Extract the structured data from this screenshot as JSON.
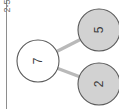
{
  "figure": {
    "axis_label": "2-5",
    "background_color": "#ffffff",
    "axis_line_color": "#8e8e8e",
    "orientation": "rotated-90-ccw"
  },
  "graph": {
    "node_fill_root": "#ffffff",
    "node_fill_leaf": "#d2d2d2",
    "node_stroke": "#5a5a5a",
    "edge_color": "#b9b9b9",
    "nodes": [
      {
        "id": "root",
        "label": "7",
        "cx": 38,
        "cy": 61,
        "r": 21,
        "kind": "root"
      },
      {
        "id": "leaf-5",
        "label": "5",
        "cx": 99,
        "cy": 30,
        "r": 21,
        "kind": "leaf"
      },
      {
        "id": "leaf-2",
        "label": "2",
        "cx": 99,
        "cy": 84,
        "r": 21,
        "kind": "leaf"
      }
    ],
    "edges": [
      {
        "from": "root",
        "to": "leaf-5"
      },
      {
        "from": "root",
        "to": "leaf-2"
      }
    ]
  }
}
